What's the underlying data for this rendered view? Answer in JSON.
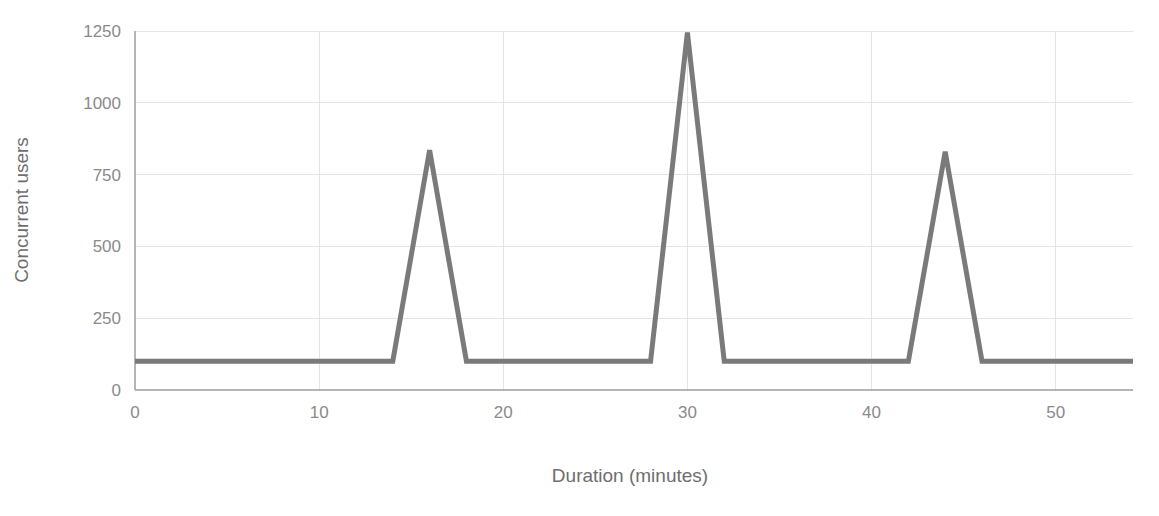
{
  "chart_data": {
    "type": "line",
    "title": "",
    "xlabel": "Duration (minutes)",
    "ylabel": "Concurrent users",
    "xlim": [
      0,
      54.2
    ],
    "ylim": [
      0,
      1290
    ],
    "grid": true,
    "legend": false,
    "legend_position": "none",
    "line_color": "#7a7a7a",
    "line_width": 5,
    "gridline_color": "#e4e4e4",
    "axis_color": "#b5b5b5",
    "tick_label_color": "#8a8a8a",
    "axis_title_color": "#6e6e6e",
    "xticks": [
      0,
      10,
      20,
      30,
      40,
      50
    ],
    "xtick_labels": [
      "0",
      "10",
      "20",
      "30",
      "40",
      "50"
    ],
    "yticks": [
      0,
      250,
      500,
      750,
      1000,
      1250
    ],
    "ytick_labels": [
      "0",
      "250",
      "500",
      "750",
      "1000",
      "1250"
    ],
    "series": [
      {
        "name": "Concurrent users",
        "x": [
          0,
          14,
          16,
          18,
          28,
          30,
          32,
          42,
          44,
          46,
          54.2
        ],
        "values": [
          100,
          100,
          835,
          100,
          100,
          1245,
          100,
          100,
          830,
          100,
          100
        ]
      }
    ],
    "annotations": []
  }
}
